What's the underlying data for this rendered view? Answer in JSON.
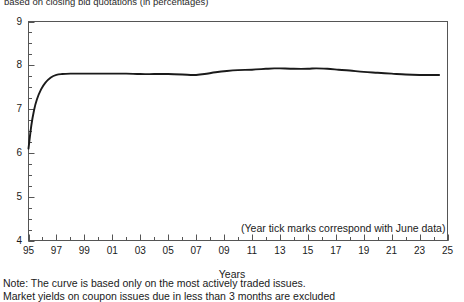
{
  "title_clipped": "based on closing bid quotations (in percentages)",
  "axis": {
    "x_title": "Years",
    "y_ticks": [
      "9",
      "8",
      "7",
      "6",
      "5",
      "4"
    ],
    "x_ticks": [
      "95",
      "97",
      "99",
      "01",
      "03",
      "05",
      "07",
      "09",
      "11",
      "13",
      "15",
      "17",
      "19",
      "21",
      "23",
      "25"
    ]
  },
  "annotation": "(Year tick marks correspond with June data)",
  "notes": [
    "Note: The curve is based only on the most actively traded issues.",
    "Market yields on coupon issues due in less than 3 months are excluded"
  ],
  "colors": {
    "curve": "#1a1a1a",
    "frame": "#555555",
    "background": "#ffffff"
  },
  "chart_data": {
    "type": "line",
    "title": "based on closing bid quotations (in percentages)",
    "xlabel": "Years",
    "ylabel": "",
    "xlim": [
      1995,
      2025
    ],
    "ylim": [
      4,
      9
    ],
    "grid": false,
    "legend": null,
    "y_tick_values": [
      4,
      5,
      6,
      7,
      8,
      9
    ],
    "y_minor_tick_step": 0.25,
    "x_tick_values": [
      1995,
      1997,
      1999,
      2001,
      2003,
      2005,
      2007,
      2009,
      2011,
      2013,
      2015,
      2017,
      2019,
      2021,
      2023,
      2025
    ],
    "x_minor_tick_step": 1,
    "annotations": [
      "(Year tick marks correspond with June data)"
    ],
    "series": [
      {
        "name": "Yield curve",
        "x": [
          1995.0,
          1995.2,
          1995.4,
          1995.6,
          1995.9,
          1996.2,
          1996.6,
          1997.0,
          1997.4,
          1998.0,
          1999.0,
          2000.0,
          2001.0,
          2002.0,
          2003.0,
          2004.0,
          2005.0,
          2006.0,
          2006.6,
          2007.0,
          2007.6,
          2008.4,
          2009.2,
          2010.0,
          2011.0,
          2012.0,
          2012.6,
          2013.0,
          2014.0,
          2015.0,
          2015.6,
          2016.4,
          2017.2,
          2018.0,
          2019.0,
          2020.0,
          2021.0,
          2022.0,
          2023.0,
          2024.0,
          2024.4
        ],
        "y": [
          6.1,
          6.62,
          6.98,
          7.22,
          7.45,
          7.6,
          7.72,
          7.78,
          7.8,
          7.81,
          7.81,
          7.81,
          7.81,
          7.81,
          7.8,
          7.8,
          7.8,
          7.79,
          7.78,
          7.78,
          7.8,
          7.84,
          7.87,
          7.89,
          7.9,
          7.92,
          7.93,
          7.93,
          7.92,
          7.92,
          7.93,
          7.92,
          7.9,
          7.88,
          7.85,
          7.83,
          7.81,
          7.79,
          7.78,
          7.78,
          7.78
        ]
      }
    ]
  }
}
